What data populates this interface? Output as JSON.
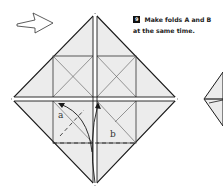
{
  "step": {
    "number": "9",
    "instruction_line1": "Make folds A and B",
    "instruction_line2": "at the same time."
  },
  "labels": {
    "fold_a": "a",
    "fold_b": "b"
  },
  "icons": {
    "direction_arrow": "hollow-right-arrow"
  },
  "colors": {
    "paper_fill": "#ececec",
    "line": "#1a1a1a",
    "background": "#ffffff"
  }
}
